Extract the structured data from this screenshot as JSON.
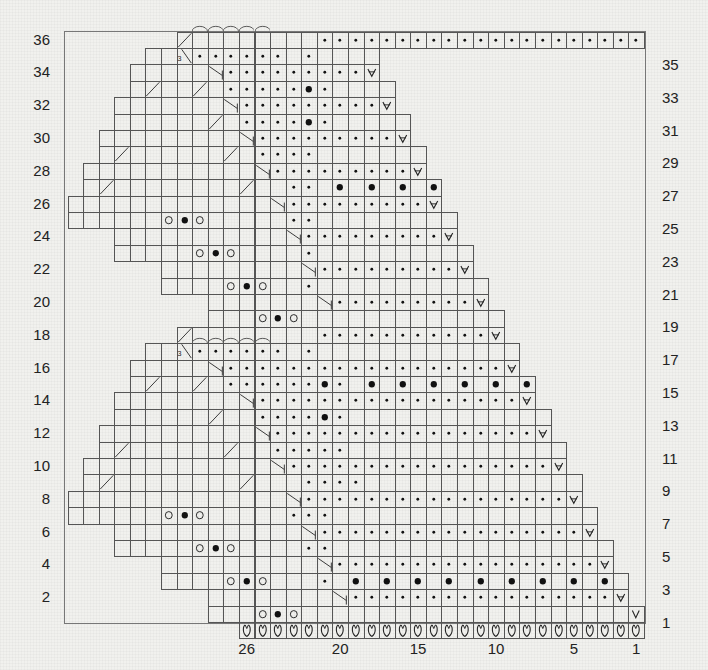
{
  "chart_data": {
    "type": "knitting-chart",
    "title": "",
    "grid": {
      "columns_labeled": 26,
      "rows": 36,
      "cell_width_px": 15.58,
      "cell_height_px": 16.4,
      "origin_right_x": 644,
      "origin_bottom_y": 622
    },
    "left_row_labels": [
      "36",
      "34",
      "32",
      "30",
      "28",
      "26",
      "24",
      "22",
      "20",
      "18",
      "16",
      "14",
      "12",
      "10",
      "8",
      "6",
      "4",
      "2"
    ],
    "right_row_labels": [
      "35",
      "33",
      "31",
      "29",
      "27",
      "25",
      "23",
      "21",
      "19",
      "17",
      "15",
      "13",
      "11",
      "9",
      "7",
      "5",
      "3",
      "1"
    ],
    "column_labels": [
      {
        "col": 26,
        "text": "26"
      },
      {
        "col": 20,
        "text": "20"
      },
      {
        "col": 15,
        "text": "15"
      },
      {
        "col": 10,
        "text": "10"
      },
      {
        "col": 5,
        "text": "5"
      },
      {
        "col": 1,
        "text": "1"
      }
    ],
    "legend_symbols": {
      "dot": "purl",
      "big-dot": "bobble / knot",
      "open-circle": "yarn over",
      "v-increase": "increase",
      "v": "slip stitch",
      "cast-on-loop": "cast on",
      "arc": "bind off",
      "slash-right": "k2tog",
      "slash-left": "ssk",
      "three": "3"
    },
    "rows_spec": [
      {
        "row": 0,
        "from": 26,
        "to": 1,
        "fill": "cast-on-loop"
      },
      {
        "row": 1,
        "from": 28,
        "to": 1,
        "symbols": [
          [
            25,
            "open-circle"
          ],
          [
            24,
            "big-dot"
          ],
          [
            23,
            "open-circle"
          ],
          [
            1,
            "v"
          ]
        ]
      },
      {
        "row": 2,
        "from": 28,
        "to": 2,
        "symbols": [
          [
            20,
            "slash-left"
          ]
        ],
        "dots": [
          19,
          3
        ],
        "end": [
          2,
          "v-increase"
        ]
      },
      {
        "row": 3,
        "from": 31,
        "to": 2,
        "symbols": [
          [
            27,
            "open-circle"
          ],
          [
            26,
            "big-dot"
          ],
          [
            25,
            "open-circle"
          ],
          [
            21,
            "dot"
          ],
          [
            19,
            "big-dot"
          ],
          [
            17,
            "big-dot"
          ],
          [
            15,
            "big-dot"
          ],
          [
            13,
            "big-dot"
          ],
          [
            11,
            "big-dot"
          ],
          [
            9,
            "big-dot"
          ],
          [
            7,
            "big-dot"
          ],
          [
            5,
            "big-dot"
          ],
          [
            3,
            "big-dot"
          ]
        ]
      },
      {
        "row": 4,
        "from": 31,
        "to": 3,
        "symbols": [
          [
            21,
            "slash-left"
          ]
        ],
        "dots": [
          20,
          4
        ],
        "end": [
          3,
          "v-increase"
        ]
      },
      {
        "row": 5,
        "from": 34,
        "to": 3,
        "symbols": [
          [
            29,
            "open-circle"
          ],
          [
            28,
            "big-dot"
          ],
          [
            27,
            "open-circle"
          ],
          [
            22,
            "dot"
          ],
          [
            21,
            "dot"
          ]
        ]
      },
      {
        "row": 6,
        "from": 34,
        "to": 4,
        "symbols": [
          [
            22,
            "slash-left"
          ]
        ],
        "dots": [
          21,
          5
        ],
        "end": [
          4,
          "v-increase"
        ]
      },
      {
        "row": 7,
        "from": 37,
        "to": 4,
        "symbols": [
          [
            31,
            "open-circle"
          ],
          [
            30,
            "big-dot"
          ],
          [
            29,
            "open-circle"
          ],
          [
            23,
            "dot"
          ],
          [
            22,
            "dot"
          ],
          [
            21,
            "dot"
          ]
        ]
      },
      {
        "row": 8,
        "from": 37,
        "to": 5,
        "symbols": [
          [
            23,
            "slash-left"
          ]
        ],
        "dots": [
          22,
          6
        ],
        "end": [
          5,
          "v-increase"
        ]
      },
      {
        "row": 9,
        "from": 36,
        "to": 5,
        "symbols": [
          [
            35,
            "slash-right"
          ],
          [
            26,
            "slash-right"
          ],
          [
            22,
            "dot"
          ],
          [
            21,
            "dot"
          ],
          [
            20,
            "dot"
          ],
          [
            19,
            "dot"
          ]
        ]
      },
      {
        "row": 10,
        "from": 36,
        "to": 6,
        "symbols": [
          [
            24,
            "slash-left"
          ]
        ],
        "dots": [
          23,
          7
        ],
        "end": [
          6,
          "v-increase"
        ]
      },
      {
        "row": 11,
        "from": 35,
        "to": 6,
        "symbols": [
          [
            34,
            "slash-right"
          ],
          [
            27,
            "slash-right"
          ],
          [
            24,
            "dot"
          ],
          [
            23,
            "dot"
          ],
          [
            22,
            "dot"
          ],
          [
            21,
            "dot"
          ],
          [
            20,
            "dot"
          ]
        ]
      },
      {
        "row": 12,
        "from": 35,
        "to": 7,
        "symbols": [
          [
            25,
            "slash-left"
          ]
        ],
        "dots": [
          24,
          8
        ],
        "end": [
          7,
          "v-increase"
        ]
      },
      {
        "row": 13,
        "from": 34,
        "to": 7,
        "symbols": [
          [
            28,
            "slash-right"
          ],
          [
            25,
            "dot"
          ],
          [
            24,
            "dot"
          ],
          [
            23,
            "dot"
          ],
          [
            22,
            "dot"
          ],
          [
            21,
            "big-dot"
          ],
          [
            20,
            "dot"
          ]
        ]
      },
      {
        "row": 14,
        "from": 34,
        "to": 8,
        "symbols": [
          [
            26,
            "slash-left"
          ]
        ],
        "dots": [
          25,
          9
        ],
        "end": [
          8,
          "v-increase"
        ]
      },
      {
        "row": 15,
        "from": 33,
        "to": 8,
        "symbols": [
          [
            32,
            "slash-right"
          ],
          [
            29,
            "slash-right"
          ],
          [
            27,
            "dot"
          ],
          [
            26,
            "dot"
          ],
          [
            25,
            "dot"
          ],
          [
            24,
            "dot"
          ],
          [
            23,
            "dot"
          ],
          [
            22,
            "dot"
          ],
          [
            21,
            "big-dot"
          ],
          [
            20,
            "dot"
          ],
          [
            18,
            "big-dot"
          ],
          [
            16,
            "big-dot"
          ],
          [
            14,
            "big-dot"
          ],
          [
            12,
            "big-dot"
          ],
          [
            10,
            "big-dot"
          ],
          [
            8,
            "big-dot"
          ]
        ]
      },
      {
        "row": 16,
        "from": 33,
        "to": 9,
        "symbols": [
          [
            28,
            "slash-left"
          ]
        ],
        "dots": [
          27,
          10
        ],
        "end": [
          9,
          "v-increase"
        ]
      },
      {
        "row": 17,
        "from": 32,
        "to": 9,
        "symbols": [
          [
            30,
            "slash-right-3"
          ],
          [
            29,
            "dot"
          ],
          [
            28,
            "dot"
          ],
          [
            27,
            "dot"
          ],
          [
            26,
            "dot"
          ],
          [
            25,
            "dot"
          ],
          [
            24,
            "dot"
          ],
          [
            22,
            "dot"
          ]
        ],
        "arcs": [
          29,
          25
        ]
      },
      {
        "row": 18,
        "from": 30,
        "to": 10,
        "symbols": [
          [
            30,
            "slash-right"
          ],
          [
            21,
            "dot"
          ],
          [
            20,
            "dot"
          ],
          [
            19,
            "dot"
          ],
          [
            18,
            "dot"
          ],
          [
            17,
            "dot"
          ],
          [
            16,
            "dot"
          ],
          [
            15,
            "dot"
          ],
          [
            14,
            "dot"
          ],
          [
            13,
            "dot"
          ],
          [
            12,
            "dot"
          ],
          [
            11,
            "dot"
          ],
          [
            10,
            "v-increase"
          ]
        ]
      },
      {
        "row": 19,
        "from": 28,
        "to": 10,
        "symbols": [
          [
            25,
            "open-circle"
          ],
          [
            24,
            "big-dot"
          ],
          [
            23,
            "open-circle"
          ]
        ]
      },
      {
        "row": 20,
        "from": 28,
        "to": 11,
        "symbols": [
          [
            21,
            "slash-left"
          ]
        ],
        "dots": [
          20,
          12
        ],
        "end": [
          11,
          "v-increase"
        ]
      },
      {
        "row": 21,
        "from": 31,
        "to": 11,
        "symbols": [
          [
            27,
            "open-circle"
          ],
          [
            26,
            "big-dot"
          ],
          [
            25,
            "open-circle"
          ],
          [
            22,
            "dot"
          ]
        ]
      },
      {
        "row": 22,
        "from": 31,
        "to": 12,
        "symbols": [
          [
            22,
            "slash-left"
          ]
        ],
        "dots": [
          21,
          13
        ],
        "end": [
          12,
          "v-increase"
        ]
      },
      {
        "row": 23,
        "from": 34,
        "to": 12,
        "symbols": [
          [
            29,
            "open-circle"
          ],
          [
            28,
            "big-dot"
          ],
          [
            27,
            "open-circle"
          ],
          [
            22,
            "dot"
          ]
        ]
      },
      {
        "row": 24,
        "from": 34,
        "to": 13,
        "symbols": [
          [
            23,
            "slash-left"
          ]
        ],
        "dots": [
          22,
          14
        ],
        "end": [
          13,
          "v-increase"
        ]
      },
      {
        "row": 25,
        "from": 37,
        "to": 13,
        "symbols": [
          [
            31,
            "open-circle"
          ],
          [
            30,
            "big-dot"
          ],
          [
            29,
            "open-circle"
          ],
          [
            23,
            "dot"
          ],
          [
            22,
            "dot"
          ]
        ]
      },
      {
        "row": 26,
        "from": 37,
        "to": 14,
        "symbols": [
          [
            24,
            "slash-left"
          ]
        ],
        "dots": [
          23,
          15
        ],
        "end": [
          14,
          "v-increase"
        ]
      },
      {
        "row": 27,
        "from": 36,
        "to": 14,
        "symbols": [
          [
            35,
            "slash-right"
          ],
          [
            26,
            "slash-right"
          ],
          [
            23,
            "dot"
          ],
          [
            22,
            "dot"
          ],
          [
            20,
            "big-dot"
          ],
          [
            18,
            "big-dot"
          ],
          [
            16,
            "big-dot"
          ],
          [
            14,
            "big-dot"
          ]
        ]
      },
      {
        "row": 28,
        "from": 36,
        "to": 15,
        "symbols": [
          [
            25,
            "slash-left"
          ]
        ],
        "dots": [
          24,
          16
        ],
        "end": [
          15,
          "v-increase"
        ]
      },
      {
        "row": 29,
        "from": 35,
        "to": 15,
        "symbols": [
          [
            34,
            "slash-right"
          ],
          [
            27,
            "slash-right"
          ],
          [
            25,
            "dot"
          ],
          [
            24,
            "dot"
          ],
          [
            23,
            "dot"
          ],
          [
            22,
            "dot"
          ]
        ]
      },
      {
        "row": 30,
        "from": 35,
        "to": 16,
        "symbols": [
          [
            26,
            "slash-left"
          ]
        ],
        "dots": [
          25,
          17
        ],
        "end": [
          16,
          "v-increase"
        ]
      },
      {
        "row": 31,
        "from": 34,
        "to": 16,
        "symbols": [
          [
            28,
            "slash-right"
          ],
          [
            26,
            "dot"
          ],
          [
            25,
            "dot"
          ],
          [
            24,
            "dot"
          ],
          [
            23,
            "dot"
          ],
          [
            22,
            "big-dot"
          ],
          [
            21,
            "dot"
          ]
        ]
      },
      {
        "row": 32,
        "from": 34,
        "to": 17,
        "symbols": [
          [
            27,
            "slash-left"
          ]
        ],
        "dots": [
          26,
          18
        ],
        "end": [
          17,
          "v-increase"
        ]
      },
      {
        "row": 33,
        "from": 33,
        "to": 17,
        "symbols": [
          [
            32,
            "slash-right"
          ],
          [
            29,
            "slash-right"
          ],
          [
            27,
            "dot"
          ],
          [
            26,
            "dot"
          ],
          [
            25,
            "dot"
          ],
          [
            24,
            "dot"
          ],
          [
            23,
            "dot"
          ],
          [
            22,
            "big-dot"
          ],
          [
            21,
            "dot"
          ]
        ]
      },
      {
        "row": 34,
        "from": 33,
        "to": 18,
        "symbols": [
          [
            28,
            "slash-left"
          ]
        ],
        "dots": [
          27,
          19
        ],
        "end": [
          18,
          "v-increase"
        ]
      },
      {
        "row": 35,
        "from": 32,
        "to": 18,
        "symbols": [
          [
            30,
            "slash-right-3"
          ],
          [
            29,
            "dot"
          ],
          [
            28,
            "dot"
          ],
          [
            27,
            "dot"
          ],
          [
            26,
            "dot"
          ],
          [
            25,
            "dot"
          ],
          [
            24,
            "dot"
          ],
          [
            22,
            "dot"
          ]
        ]
      },
      {
        "row": 36,
        "from": 30,
        "to": 1,
        "symbols": [
          [
            30,
            "slash-right"
          ]
        ],
        "arcs": [
          29,
          25
        ],
        "dots": [
          21,
          1
        ]
      }
    ]
  },
  "frame": {
    "left": 64,
    "top": 31,
    "right": 644,
    "bottom": 622
  }
}
